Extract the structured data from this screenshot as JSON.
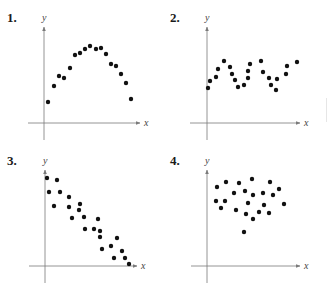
{
  "chart_data": [
    {
      "type": "scatter",
      "label": "1.",
      "xlabel": "x",
      "ylabel": "y",
      "grid": false,
      "description": "Quadratic (inverted parabola) pattern",
      "axes": {
        "origin": [
          44,
          123
        ],
        "x_end": 140,
        "y_top": 27,
        "x_start": 28,
        "y_bottom": 140
      },
      "points_px": [
        [
          48,
          102
        ],
        [
          54,
          86
        ],
        [
          59,
          76
        ],
        [
          64,
          78
        ],
        [
          70,
          68
        ],
        [
          75,
          55
        ],
        [
          80,
          53
        ],
        [
          85,
          49
        ],
        [
          90,
          46
        ],
        [
          96,
          49
        ],
        [
          101,
          48
        ],
        [
          106,
          54
        ],
        [
          111,
          64
        ],
        [
          116,
          66
        ],
        [
          121,
          74
        ],
        [
          126,
          83
        ],
        [
          131,
          99
        ]
      ]
    },
    {
      "type": "scatter",
      "label": "2.",
      "xlabel": "x",
      "ylabel": "y",
      "grid": false,
      "description": "Oscillating / periodic pattern",
      "axes": {
        "origin": [
          207,
          123
        ],
        "x_end": 300,
        "y_top": 27,
        "x_start": 190,
        "y_bottom": 140
      },
      "points_px": [
        [
          208,
          88
        ],
        [
          210,
          81
        ],
        [
          216,
          77
        ],
        [
          218,
          69
        ],
        [
          224,
          61
        ],
        [
          230,
          67
        ],
        [
          232,
          74
        ],
        [
          235,
          80
        ],
        [
          238,
          87
        ],
        [
          244,
          85
        ],
        [
          248,
          78
        ],
        [
          248,
          71
        ],
        [
          250,
          64
        ],
        [
          261,
          61
        ],
        [
          263,
          72
        ],
        [
          269,
          78
        ],
        [
          271,
          85
        ],
        [
          276,
          90
        ],
        [
          277,
          79
        ],
        [
          286,
          74
        ],
        [
          287,
          66
        ],
        [
          297,
          62
        ]
      ]
    },
    {
      "type": "scatter",
      "label": "3.",
      "xlabel": "x",
      "ylabel": "y",
      "grid": false,
      "description": "Negative linear pattern",
      "axes": {
        "origin": [
          45,
          266
        ],
        "x_end": 137,
        "y_top": 170,
        "x_start": 29,
        "y_bottom": 283
      },
      "points_px": [
        [
          47,
          178
        ],
        [
          57,
          180
        ],
        [
          49,
          192
        ],
        [
          60,
          192
        ],
        [
          54,
          206
        ],
        [
          69,
          197
        ],
        [
          69,
          207
        ],
        [
          80,
          204
        ],
        [
          79,
          210
        ],
        [
          72,
          218
        ],
        [
          84,
          217
        ],
        [
          98,
          219
        ],
        [
          85,
          229
        ],
        [
          94,
          229
        ],
        [
          100,
          231
        ],
        [
          100,
          237
        ],
        [
          117,
          238
        ],
        [
          102,
          249
        ],
        [
          111,
          246
        ],
        [
          122,
          251
        ],
        [
          114,
          258
        ],
        [
          125,
          258
        ],
        [
          129,
          264
        ]
      ]
    },
    {
      "type": "scatter",
      "label": "4.",
      "xlabel": "x",
      "ylabel": "y",
      "grid": false,
      "description": "No apparent correlation",
      "axes": {
        "origin": [
          207,
          266
        ],
        "x_end": 300,
        "y_top": 170,
        "x_start": 191,
        "y_bottom": 283
      },
      "points_px": [
        [
          217,
          187
        ],
        [
          226,
          182
        ],
        [
          239,
          183
        ],
        [
          252,
          179
        ],
        [
          270,
          182
        ],
        [
          279,
          189
        ],
        [
          234,
          193
        ],
        [
          245,
          191
        ],
        [
          253,
          195
        ],
        [
          263,
          193
        ],
        [
          273,
          195
        ],
        [
          216,
          201
        ],
        [
          225,
          201
        ],
        [
          248,
          203
        ],
        [
          264,
          205
        ],
        [
          284,
          204
        ],
        [
          221,
          208
        ],
        [
          236,
          210
        ],
        [
          246,
          214
        ],
        [
          259,
          212
        ],
        [
          269,
          213
        ],
        [
          253,
          219
        ],
        [
          244,
          232
        ]
      ]
    }
  ],
  "panels": [
    {
      "number": "1.",
      "xlabel": "x",
      "ylabel": "y"
    },
    {
      "number": "2.",
      "xlabel": "x",
      "ylabel": "y"
    },
    {
      "number": "3.",
      "xlabel": "x",
      "ylabel": "y"
    },
    {
      "number": "4.",
      "xlabel": "x",
      "ylabel": "y"
    }
  ],
  "colors": {
    "axis": "#7a7a7a",
    "dot": "#111111",
    "text": "#1a1a1a"
  }
}
